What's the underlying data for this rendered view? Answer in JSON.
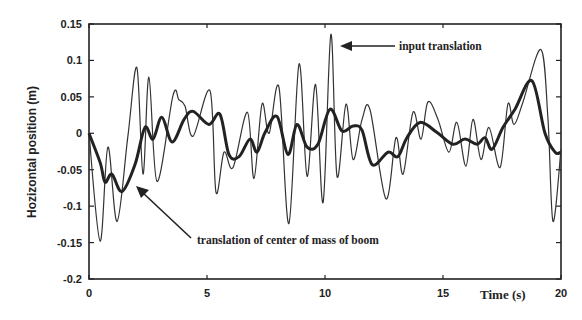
{
  "chart_data": {
    "type": "line",
    "title": "",
    "xlabel": "Time (s)",
    "ylabel": "Hozizontal position (m)",
    "xlim": [
      0,
      20
    ],
    "ylim": [
      -0.2,
      0.15
    ],
    "x_ticks": [
      "0",
      "5",
      "10",
      "15",
      "20"
    ],
    "y_ticks": [
      "0.15",
      "0.1",
      "0.05",
      "0",
      "-0.05",
      "-0.1",
      "-0.15",
      "-0.2"
    ],
    "grid": false,
    "legend": "none (inline annotations with arrows)",
    "annotations": [
      {
        "text": "input translation",
        "points_to": "input translation peak near t=10.5"
      },
      {
        "text": "translation of center of mass of boom",
        "points_to": "boom curve near t=1.9"
      }
    ],
    "series": [
      {
        "name": "input translation",
        "style": "thin",
        "x": [
          0,
          0.47,
          0.8,
          1.19,
          1.65,
          2.03,
          2.29,
          2.54,
          2.88,
          3.56,
          3.81,
          4.07,
          4.41,
          5.13,
          5.38,
          5.72,
          6.1,
          6.71,
          6.99,
          7.33,
          7.63,
          8.05,
          8.47,
          8.9,
          9.24,
          9.6,
          9.92,
          10.25,
          10.51,
          10.89,
          11.19,
          11.57,
          11.91,
          12.58,
          13.01,
          13.31,
          13.73,
          14.07,
          14.36,
          14.79,
          15.25,
          15.59,
          15.97,
          16.27,
          16.61,
          16.95,
          17.42,
          17.75,
          18.01,
          18.39,
          19.15,
          19.45,
          19.66,
          20.0
        ],
        "y": [
          0.0,
          -0.148,
          -0.019,
          -0.121,
          -0.004,
          0.09,
          -0.056,
          0.077,
          -0.066,
          0.052,
          0.046,
          0.037,
          -0.004,
          0.058,
          -0.081,
          -0.026,
          -0.047,
          0.029,
          -0.062,
          0.04,
          0.0,
          0.063,
          -0.124,
          0.095,
          -0.059,
          0.067,
          -0.095,
          0.136,
          -0.059,
          0.04,
          -0.036,
          0.019,
          0.032,
          -0.09,
          -0.006,
          -0.056,
          0.029,
          -0.008,
          0.043,
          0.019,
          -0.026,
          0.015,
          -0.045,
          0.019,
          -0.036,
          0.008,
          -0.047,
          0.04,
          0.012,
          0.043,
          0.115,
          0.019,
          -0.121,
          -0.022
        ]
      },
      {
        "name": "translation of center of mass of boom",
        "style": "thick",
        "x": [
          0,
          0.47,
          0.68,
          0.97,
          1.4,
          1.95,
          2.37,
          2.71,
          3.09,
          3.52,
          4.03,
          4.41,
          5.08,
          5.55,
          5.93,
          6.36,
          6.82,
          7.12,
          7.46,
          7.97,
          8.43,
          8.81,
          9.24,
          9.7,
          10.21,
          10.72,
          11.19,
          11.57,
          12.0,
          12.67,
          13.09,
          13.47,
          14.03,
          14.75,
          15.42,
          15.93,
          16.44,
          16.78,
          17.08,
          17.54,
          18.05,
          18.77,
          19.32,
          19.75,
          19.98
        ],
        "y": [
          0.0,
          -0.04,
          -0.067,
          -0.056,
          -0.08,
          -0.043,
          0.008,
          -0.008,
          0.022,
          -0.012,
          0.019,
          0.03,
          0.012,
          0.026,
          -0.029,
          -0.032,
          -0.008,
          -0.026,
          0.001,
          0.023,
          -0.029,
          0.012,
          -0.019,
          -0.015,
          0.033,
          0.003,
          0.01,
          0.004,
          -0.043,
          -0.026,
          -0.032,
          -0.006,
          0.015,
          0.001,
          -0.015,
          -0.008,
          -0.015,
          -0.006,
          -0.022,
          0.008,
          0.033,
          0.072,
          0.0,
          -0.026,
          -0.026
        ]
      }
    ]
  }
}
